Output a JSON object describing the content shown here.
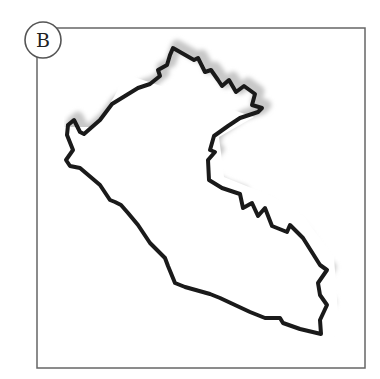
{
  "figure": {
    "panel_label": "B",
    "frame": {
      "x": 37,
      "y": 28,
      "width": 328,
      "height": 340,
      "stroke": "#666666"
    },
    "label_circle": {
      "cx": 43,
      "cy": 40,
      "r": 18,
      "stroke": "#555555"
    },
    "outline": {
      "stroke": "#1a1a1a",
      "shadow": "#c8c8c8",
      "points": "173,48 180,52 194,60 198,58 205,72 211,70 218,80 222,86 229,80 236,92 244,86 255,94 252,105 262,108 258,112 240,118 228,126 214,136 210,150 215,152 208,160 209,180 222,188 240,194 243,208 252,203 258,216 265,208 272,226 287,232 290,225 303,238 320,265 327,270 318,283 320,295 327,305 320,320 321,334 300,329 283,323 280,318 265,318 250,312 220,298 210,294 185,287 175,283 168,266 165,258 150,243 138,225 128,213 121,205 115,202 110,200 100,185 80,168 70,166 66,160 73,150 67,135 68,125 74,120 80,132 84,134 100,120 112,104 138,88 150,84 160,76 158,70 167,65 170,55"
    }
  }
}
